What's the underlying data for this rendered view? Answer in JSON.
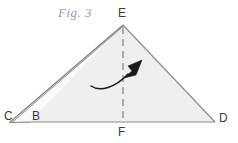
{
  "figure": {
    "caption": "Fig. 3",
    "caption_color": "#9a9a9a",
    "background_color": "#ffffff",
    "paper_fill_color": "#efefef",
    "outline_color": "#808080",
    "dash_color": "#9b9b9b",
    "arrow_color": "#1a1a1a",
    "label_color": "#3b3b3b",
    "labels": {
      "apex": "E",
      "left_outer": "C",
      "left_inner": "B",
      "base_midpoint": "F",
      "right": "D"
    },
    "points": {
      "E": [
        123,
        25
      ],
      "C": [
        10,
        122
      ],
      "B": [
        30,
        122
      ],
      "D": [
        215,
        122
      ],
      "F": [
        123,
        122
      ]
    },
    "fold_line": {
      "from": "E",
      "to": "F",
      "style": "dashed",
      "dash_length": 7,
      "dash_gap": 5
    },
    "motion_arrow": {
      "description": "curved arrow indicating fold direction",
      "start": [
        91,
        86
      ],
      "end": [
        141,
        61
      ],
      "head": "solid-triangle",
      "direction": "up-right"
    },
    "flap": {
      "description": "thin folded sliver along edge C-E",
      "outer_edge": [
        "C",
        "E"
      ],
      "inner_edge": [
        "B",
        "E"
      ]
    }
  }
}
